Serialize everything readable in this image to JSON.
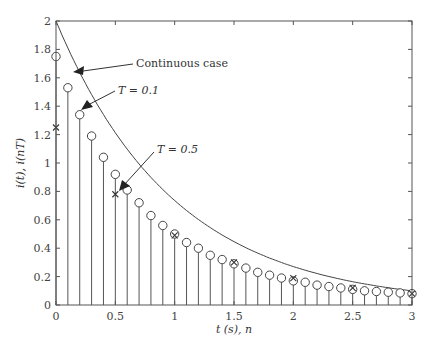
{
  "chart_data": {
    "type": "line",
    "title": "",
    "xlabel": "t (s), n",
    "ylabel": "i(t), i(nT)",
    "xlim": [
      0,
      3
    ],
    "ylim": [
      0,
      2
    ],
    "xticks": [
      "0",
      "0.5",
      "1",
      "1.5",
      "2",
      "2.5",
      "3"
    ],
    "yticks": [
      "0",
      "0.2",
      "0.4",
      "0.6",
      "0.8",
      "1",
      "1.2",
      "1.4",
      "1.6",
      "1.8",
      "2"
    ],
    "grid": false,
    "series": [
      {
        "name": "Continuous case",
        "style": "solid line",
        "x": [
          0,
          0.25,
          0.5,
          0.75,
          1,
          1.25,
          1.5,
          1.75,
          2,
          2.25,
          2.5,
          2.75,
          3
        ],
        "values": [
          2.0,
          1.56,
          1.21,
          0.94,
          0.74,
          0.57,
          0.45,
          0.35,
          0.27,
          0.21,
          0.16,
          0.13,
          0.1
        ]
      },
      {
        "name": "T = 0.1",
        "style": "stem with circle markers",
        "x": [
          0,
          0.1,
          0.2,
          0.3,
          0.4,
          0.5,
          0.6,
          0.7,
          0.8,
          0.9,
          1.0,
          1.1,
          1.2,
          1.3,
          1.4,
          1.5,
          1.6,
          1.7,
          1.8,
          1.9,
          2.0,
          2.1,
          2.2,
          2.3,
          2.4,
          2.5,
          2.6,
          2.7,
          2.8,
          2.9,
          3.0
        ],
        "values": [
          1.75,
          1.53,
          1.34,
          1.19,
          1.04,
          0.92,
          0.81,
          0.72,
          0.63,
          0.56,
          0.5,
          0.44,
          0.4,
          0.35,
          0.32,
          0.29,
          0.26,
          0.23,
          0.21,
          0.19,
          0.17,
          0.16,
          0.14,
          0.13,
          0.12,
          0.11,
          0.1,
          0.095,
          0.09,
          0.085,
          0.08
        ]
      },
      {
        "name": "T = 0.5",
        "style": "x markers",
        "x": [
          0,
          0.5,
          1.0,
          1.5,
          2.0,
          2.5,
          3.0
        ],
        "values": [
          1.25,
          0.78,
          0.49,
          0.3,
          0.19,
          0.12,
          0.08
        ]
      }
    ],
    "annotations": [
      "Continuous case",
      "T = 0.1",
      "T = 0.5"
    ]
  },
  "labels": {
    "xlabel": "t (s), n",
    "ylabel": "i(t), i(nT)",
    "ann_continuous": "Continuous case",
    "ann_t01": "T = 0.1",
    "ann_t05": "T = 0.5"
  }
}
